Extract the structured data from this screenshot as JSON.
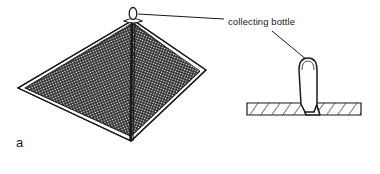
{
  "figure": {
    "panel_letter": "a",
    "background_color": "#ffffff",
    "ink_color": "#1a1a1a",
    "annotations": [
      {
        "id": "collecting-bottle",
        "text": "collecting bottle",
        "x": 228,
        "y": 22
      }
    ],
    "parts": {
      "pyramid_trap": {
        "name": "pyramid mesh trap",
        "mesh_fill": "cross-hatched netting",
        "apex_x": 133,
        "apex_y": 18,
        "left_corner_x": 18,
        "left_corner_y": 88,
        "right_corner_x": 206,
        "right_corner_y": 70,
        "front_corner_x": 131,
        "front_corner_y": 141
      },
      "apex_bottle": {
        "name": "collecting bottle at apex",
        "cx": 133,
        "cy": 14,
        "rx": 4,
        "ry": 6
      },
      "cross_section": {
        "name": "cross-section detail",
        "band_left_x": 247,
        "band_right_x": 361,
        "band_top_y": 101,
        "band_bottom_y": 115,
        "hatching": "diagonal",
        "bottle_left_x": 298,
        "bottle_right_x": 317,
        "bottle_top_y": 58,
        "bottle_bottom_y": 115
      }
    },
    "leader_lines": [
      {
        "id": "apex-leader",
        "from_x": 139,
        "from_y": 14,
        "to_x": 224,
        "to_y": 19
      },
      {
        "id": "cross-section-leader",
        "from_x": 272,
        "from_y": 30,
        "to_x": 307,
        "to_y": 60
      }
    ]
  }
}
